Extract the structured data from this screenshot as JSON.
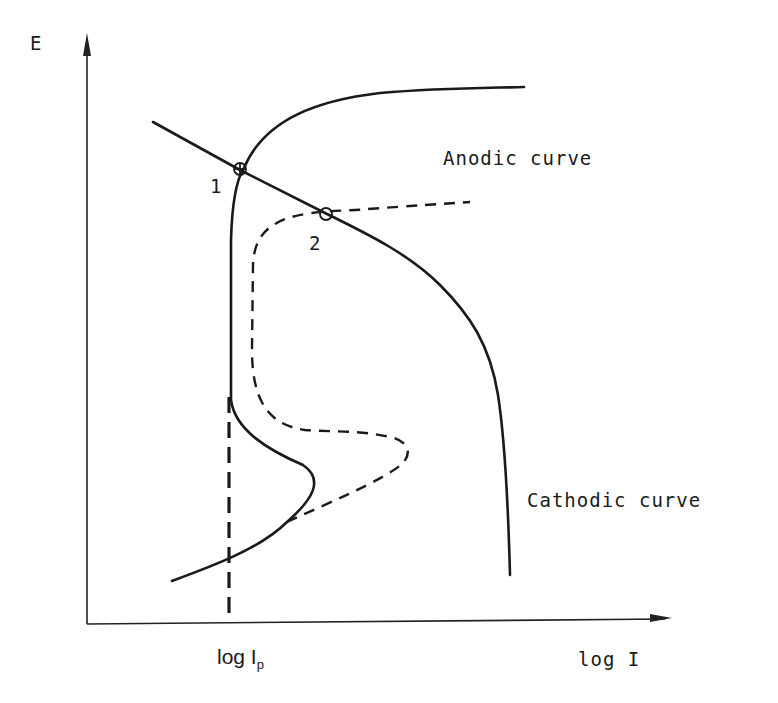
{
  "figure": {
    "type": "polarization-diagram",
    "axes": {
      "y_label": "E",
      "x_label": "log I",
      "x_tick_label_main": "log I",
      "x_tick_label_sub": "p"
    },
    "labels": {
      "anodic": "Anodic curve",
      "cathodic": "Cathodic curve",
      "point_1": "1",
      "point_2": "2"
    },
    "curves": [
      {
        "name": "anodic-curve-solid",
        "style": "solid",
        "description": "Passivating anodic curve with active peak, passive region, and transpassive rise"
      },
      {
        "name": "anodic-curve-dashed",
        "style": "dashed",
        "description": "Alternative anodic curve with larger active peak"
      },
      {
        "name": "cathodic-curve",
        "style": "solid",
        "description": "Cathodic curve with diffusion limit"
      },
      {
        "name": "passive-current-marker",
        "style": "dashed",
        "description": "Vertical line at passive current log Ip"
      }
    ],
    "intersections": [
      {
        "id": "1",
        "description": "Intersection of cathodic curve with solid anodic curve (passive)"
      },
      {
        "id": "2",
        "description": "Intersection of cathodic curve with dashed anodic curve"
      }
    ],
    "colors": {
      "ink": "#1a1a1a",
      "background": "#ffffff"
    }
  }
}
